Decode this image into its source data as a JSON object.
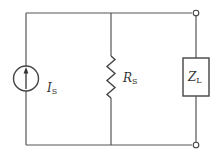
{
  "diagram": {
    "type": "circuit",
    "components": [
      {
        "id": "current-source",
        "symbol": "I",
        "subscript": "S",
        "kind": "current source (arrow up)"
      },
      {
        "id": "source-resistor",
        "symbol": "R",
        "subscript": "S",
        "kind": "resistor"
      },
      {
        "id": "load-impedance",
        "symbol": "Z",
        "subscript": "L",
        "kind": "impedance box"
      }
    ],
    "terminals": 2,
    "colors": {
      "wire": "#555555",
      "background": "#ffffff"
    }
  },
  "labels": {
    "is_main": "I",
    "is_sub": "S",
    "rs_main": "R",
    "rs_sub": "S",
    "zl_main": "Z",
    "zl_sub": "L"
  }
}
